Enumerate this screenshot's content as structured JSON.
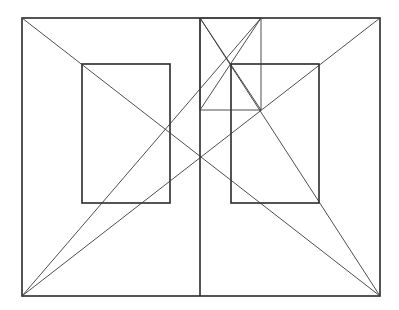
{
  "diagram": {
    "stroke_color": "#2a2a2a",
    "background": "#ffffff",
    "outer_rect": {
      "x1": 22,
      "y1": 18,
      "x2": 380,
      "y2": 296
    },
    "center_line": {
      "x": 200,
      "y1": 18,
      "y2": 296
    },
    "inner_rects": [
      {
        "name": "left",
        "x1": 82,
        "y1": 64,
        "x2": 170,
        "y2": 203
      },
      {
        "name": "right",
        "x1": 231,
        "y1": 64,
        "x2": 319,
        "y2": 203
      }
    ],
    "small_square": {
      "x1": 200,
      "y1": 18,
      "x2": 261,
      "y2": 110
    },
    "diagonals": [
      {
        "name": "tl-br",
        "x1": 22,
        "y1": 18,
        "x2": 380,
        "y2": 296
      },
      {
        "name": "tr-bl",
        "x1": 380,
        "y1": 18,
        "x2": 22,
        "y2": 296
      },
      {
        "name": "bl-to-square-top-right",
        "x1": 22,
        "y1": 296,
        "x2": 261,
        "y2": 18
      },
      {
        "name": "br-to-center-top",
        "x1": 380,
        "y1": 296,
        "x2": 200,
        "y2": 18
      },
      {
        "name": "square-diag-1",
        "x1": 200,
        "y1": 18,
        "x2": 261,
        "y2": 110
      },
      {
        "name": "square-diag-2",
        "x1": 261,
        "y1": 18,
        "x2": 200,
        "y2": 110
      }
    ]
  }
}
